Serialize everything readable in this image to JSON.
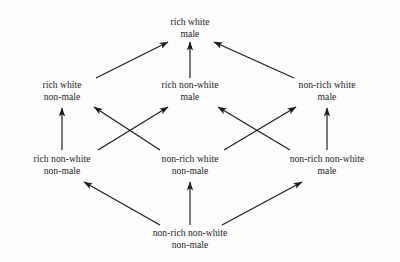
{
  "diagram": {
    "type": "hasse-lattice",
    "background_color": "#fdfdfd",
    "line_color": "#1a1a1a",
    "text_color": "#1a1a1a",
    "nodes": [
      {
        "id": "rwm",
        "lines": [
          "rich white",
          "male"
        ],
        "x": 190,
        "y": 27,
        "rank": 0
      },
      {
        "id": "rwnm",
        "lines": [
          "rich white",
          "non-male"
        ],
        "x": 62,
        "y": 90,
        "rank": 1
      },
      {
        "id": "rnwm",
        "lines": [
          "rich non-white",
          "male"
        ],
        "x": 190,
        "y": 90,
        "rank": 1
      },
      {
        "id": "nrwm",
        "lines": [
          "non-rich white",
          "male"
        ],
        "x": 327,
        "y": 90,
        "rank": 1
      },
      {
        "id": "rnwnm",
        "lines": [
          "rich non-white",
          "non-male"
        ],
        "x": 62,
        "y": 164,
        "rank": 2
      },
      {
        "id": "nrwnm",
        "lines": [
          "non-rich white",
          "non-male"
        ],
        "x": 190,
        "y": 164,
        "rank": 2
      },
      {
        "id": "nrnwm",
        "lines": [
          "non-rich non-white",
          "male"
        ],
        "x": 327,
        "y": 164,
        "rank": 2
      },
      {
        "id": "nrnwnm",
        "lines": [
          "non-rich non-white",
          "non-male"
        ],
        "x": 190,
        "y": 238,
        "rank": 3
      }
    ],
    "edges": [
      {
        "from": "rwnm",
        "to": "rwm",
        "x1": 96,
        "y1": 78,
        "x2": 168,
        "y2": 42
      },
      {
        "from": "rnwm",
        "to": "rwm",
        "x1": 190,
        "y1": 78,
        "x2": 190,
        "y2": 42
      },
      {
        "from": "nrwm",
        "to": "rwm",
        "x1": 294,
        "y1": 78,
        "x2": 214,
        "y2": 42
      },
      {
        "from": "rnwnm",
        "to": "rwnm",
        "x1": 62,
        "y1": 150,
        "x2": 62,
        "y2": 108
      },
      {
        "from": "rnwnm",
        "to": "rnwm",
        "x1": 98,
        "y1": 150,
        "x2": 168,
        "y2": 107
      },
      {
        "from": "nrwnm",
        "to": "rwnm",
        "x1": 160,
        "y1": 150,
        "x2": 94,
        "y2": 107
      },
      {
        "from": "nrwnm",
        "to": "nrwm",
        "x1": 224,
        "y1": 150,
        "x2": 296,
        "y2": 107
      },
      {
        "from": "nrnwm",
        "to": "rnwm",
        "x1": 290,
        "y1": 150,
        "x2": 218,
        "y2": 107
      },
      {
        "from": "nrnwm",
        "to": "nrwm",
        "x1": 327,
        "y1": 150,
        "x2": 327,
        "y2": 108
      },
      {
        "from": "nrnwnm",
        "to": "rnwnm",
        "x1": 160,
        "y1": 225,
        "x2": 84,
        "y2": 182
      },
      {
        "from": "nrnwnm",
        "to": "nrwnm",
        "x1": 190,
        "y1": 225,
        "x2": 190,
        "y2": 182
      },
      {
        "from": "nrnwnm",
        "to": "nrnwm",
        "x1": 222,
        "y1": 225,
        "x2": 302,
        "y2": 182
      }
    ]
  }
}
